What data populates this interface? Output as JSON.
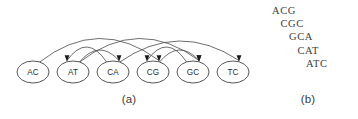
{
  "figure": {
    "panel_a": {
      "caption": "(a)",
      "nodes": [
        {
          "id": "AC",
          "label": "AC",
          "cx": 33,
          "cy": 72
        },
        {
          "id": "AT",
          "label": "AT",
          "cx": 73,
          "cy": 72
        },
        {
          "id": "CA",
          "label": "CA",
          "cx": 113,
          "cy": 72
        },
        {
          "id": "CG",
          "label": "CG",
          "cx": 153,
          "cy": 72
        },
        {
          "id": "GC",
          "label": "GC",
          "cx": 193,
          "cy": 72
        },
        {
          "id": "TC",
          "label": "TC",
          "cx": 233,
          "cy": 72
        }
      ],
      "node_rx": 16,
      "node_ry": 11,
      "edges": [
        {
          "from": "AC",
          "to": "CG",
          "span": 3,
          "height": 45
        },
        {
          "from": "AT",
          "to": "GC",
          "span": 3,
          "height": 45
        },
        {
          "from": "CA",
          "to": "TC",
          "span": 3,
          "height": 40
        },
        {
          "from": "AT",
          "to": "CA",
          "span": 1,
          "height": 22
        },
        {
          "from": "CA",
          "to": "AT",
          "span": 1,
          "height": 28,
          "backward": true
        },
        {
          "from": "CG",
          "to": "GC",
          "span": 1,
          "height": 22
        },
        {
          "from": "GC",
          "to": "CG",
          "span": 1,
          "height": 28,
          "backward": true
        }
      ]
    },
    "panel_b": {
      "caption": "(b)",
      "sequences": [
        {
          "text": "ACG",
          "indent": 0
        },
        {
          "text": "CGC",
          "indent": 1
        },
        {
          "text": "GCA",
          "indent": 2
        },
        {
          "text": "CAT",
          "indent": 3
        },
        {
          "text": "ATC",
          "indent": 4
        }
      ]
    },
    "colors": {
      "node_stroke": "#444444",
      "edge_stroke": "#555555",
      "text": "#2b2b2b",
      "background": "#ffffff"
    }
  }
}
